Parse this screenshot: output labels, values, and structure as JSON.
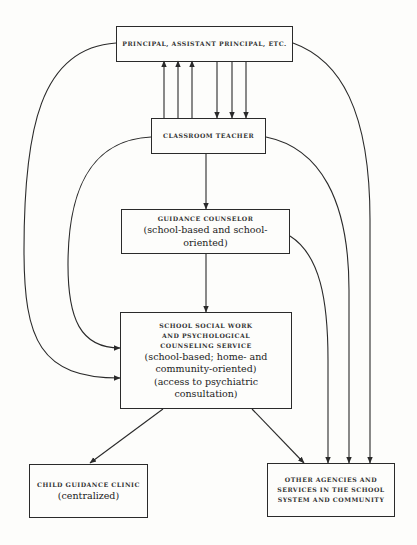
{
  "diagram": {
    "nodes": {
      "principal": {
        "title_lines": [
          "Principal, Assistant Principal, Etc."
        ],
        "notes": []
      },
      "teacher": {
        "title_lines": [
          "Classroom Teacher"
        ],
        "notes": []
      },
      "counselor": {
        "title_lines": [
          "Guidance Counselor"
        ],
        "notes": [
          "(school-based and school-oriented)"
        ]
      },
      "social_work": {
        "title_lines": [
          "School Social Work",
          "and Psychological",
          "Counseling Service"
        ],
        "notes": [
          "(school-based; home- and",
          "community-oriented)",
          "(access to psychiatric consultation)"
        ]
      },
      "clinic": {
        "title_lines": [
          "Child Guidance Clinic"
        ],
        "notes": [
          "(centralized)"
        ]
      },
      "agencies": {
        "title_lines": [
          "Other Agencies and",
          "Services in the School",
          "System and Community"
        ],
        "notes": []
      }
    },
    "edges": [
      {
        "from": "teacher",
        "to": "principal",
        "count": 3,
        "style": "straight"
      },
      {
        "from": "principal",
        "to": "teacher",
        "count": 3,
        "style": "straight"
      },
      {
        "from": "teacher",
        "to": "counselor",
        "style": "straight"
      },
      {
        "from": "counselor",
        "to": "social_work",
        "style": "straight"
      },
      {
        "from": "principal",
        "to": "social_work",
        "style": "curve-left"
      },
      {
        "from": "teacher",
        "to": "social_work",
        "style": "curve-left"
      },
      {
        "from": "social_work",
        "to": "clinic",
        "style": "diagonal"
      },
      {
        "from": "social_work",
        "to": "agencies",
        "style": "diagonal"
      },
      {
        "from": "counselor",
        "to": "agencies",
        "style": "curve-right"
      },
      {
        "from": "teacher",
        "to": "agencies",
        "style": "curve-right"
      },
      {
        "from": "principal",
        "to": "agencies",
        "style": "curve-right"
      }
    ]
  }
}
